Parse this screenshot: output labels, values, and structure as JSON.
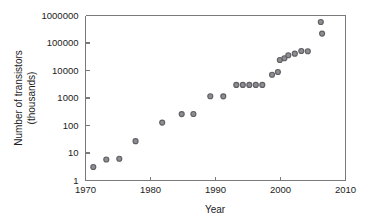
{
  "chart_data": {
    "type": "scatter",
    "title": "",
    "xlabel": "Year",
    "ylabel": "Number of transistors (thousands)",
    "ylabel_line1": "Number of transistors",
    "ylabel_line2": "(thousands)",
    "xlim": [
      1970,
      2010
    ],
    "ylim": [
      1,
      1000000
    ],
    "yscale": "log",
    "xscale": "linear",
    "grid": false,
    "legend": null,
    "xticks": [
      1970,
      1980,
      1990,
      2000,
      2010
    ],
    "xticklabels": [
      "1970",
      "1980",
      "1990",
      "2000",
      "2010"
    ],
    "yticks": [
      1,
      10,
      100,
      1000,
      10000,
      100000,
      1000000
    ],
    "yticklabels": [
      "1",
      "10",
      "100",
      "1000",
      "10000",
      "100000",
      "1000000"
    ],
    "marker_color": "#8e8e92",
    "marker_edge_color": "#5f5f64",
    "axis_color": "#7a7a7a",
    "text_color": "#1c1c1c",
    "background_color": "#ffffff",
    "x": [
      1971.2,
      1973.2,
      1975.2,
      1977.7,
      1981.8,
      1984.8,
      1986.6,
      1989.2,
      1991.2,
      1993.2,
      1994.2,
      1995.2,
      1996.2,
      1997.2,
      1998.7,
      1999.6,
      1999.9,
      2000.6,
      2001.2,
      2002.2,
      2003.2,
      2004.2,
      2006.2,
      2006.4
    ],
    "y": [
      3.1,
      5.8,
      6.2,
      27.0,
      128.0,
      260.0,
      262.0,
      1160.0,
      1150.0,
      3000.0,
      3000.0,
      3000.0,
      3000.0,
      3000.0,
      7000.0,
      8800.0,
      24000.0,
      28000.0,
      36000.0,
      41000.0,
      51000.0,
      50000.0,
      582000.0,
      220000.0
    ]
  }
}
